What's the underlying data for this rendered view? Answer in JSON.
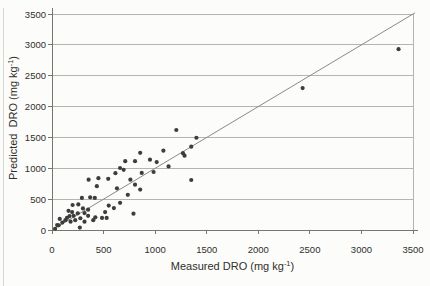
{
  "figure": {
    "x_axis_title": {
      "prefix": "Measured DRO (mg kg",
      "sup": "-1",
      "suffix": ")"
    },
    "y_axis_title": {
      "prefix": "Predicted  DRO (mg kg",
      "sup": "-1",
      "suffix": ")"
    }
  },
  "chart_data": {
    "type": "scatter",
    "title": "",
    "xlabel": "Measured DRO (mg kg-1)",
    "ylabel": "Predicted DRO (mg kg-1)",
    "xlim": [
      0,
      3500
    ],
    "ylim": [
      0,
      3500
    ],
    "xticks": [
      0,
      500,
      1000,
      1500,
      2000,
      2500,
      3000,
      3500
    ],
    "yticks": [
      0,
      500,
      1000,
      1500,
      2000,
      2500,
      3000,
      3500
    ],
    "grid": "horizontal-only",
    "legend": "none",
    "fit_line": {
      "name": "1-to-1-line",
      "x": [
        0,
        3520
      ],
      "y": [
        0,
        3520
      ]
    },
    "points": [
      [
        30,
        20
      ],
      [
        50,
        80
      ],
      [
        65,
        75
      ],
      [
        75,
        180
      ],
      [
        100,
        120
      ],
      [
        130,
        160
      ],
      [
        145,
        195
      ],
      [
        160,
        310
      ],
      [
        170,
        225
      ],
      [
        180,
        135
      ],
      [
        195,
        290
      ],
      [
        200,
        405
      ],
      [
        210,
        230
      ],
      [
        225,
        160
      ],
      [
        250,
        270
      ],
      [
        255,
        415
      ],
      [
        270,
        40
      ],
      [
        275,
        190
      ],
      [
        290,
        520
      ],
      [
        300,
        350
      ],
      [
        315,
        135
      ],
      [
        315,
        275
      ],
      [
        350,
        330
      ],
      [
        350,
        230
      ],
      [
        355,
        815
      ],
      [
        370,
        530
      ],
      [
        400,
        160
      ],
      [
        415,
        520
      ],
      [
        420,
        205
      ],
      [
        435,
        710
      ],
      [
        450,
        840
      ],
      [
        485,
        195
      ],
      [
        515,
        290
      ],
      [
        530,
        195
      ],
      [
        545,
        830
      ],
      [
        550,
        395
      ],
      [
        600,
        355
      ],
      [
        615,
        920
      ],
      [
        630,
        675
      ],
      [
        660,
        440
      ],
      [
        660,
        1005
      ],
      [
        695,
        975
      ],
      [
        710,
        1115
      ],
      [
        735,
        570
      ],
      [
        760,
        815
      ],
      [
        790,
        265
      ],
      [
        805,
        735
      ],
      [
        805,
        1115
      ],
      [
        855,
        655
      ],
      [
        855,
        1250
      ],
      [
        870,
        925
      ],
      [
        950,
        1140
      ],
      [
        985,
        940
      ],
      [
        1015,
        1100
      ],
      [
        1080,
        1285
      ],
      [
        1130,
        1030
      ],
      [
        1205,
        1620
      ],
      [
        1270,
        1245
      ],
      [
        1285,
        1205
      ],
      [
        1350,
        1350
      ],
      [
        1350,
        810
      ],
      [
        1400,
        1495
      ],
      [
        2430,
        2300
      ],
      [
        3360,
        2930
      ]
    ],
    "colors": {
      "background": "#fcfcfb",
      "grid": "#b4b4b0",
      "axis": "#76766f",
      "line": "#8a8a86",
      "point": "#3d3d3b",
      "text": "#2f2f2b"
    }
  }
}
